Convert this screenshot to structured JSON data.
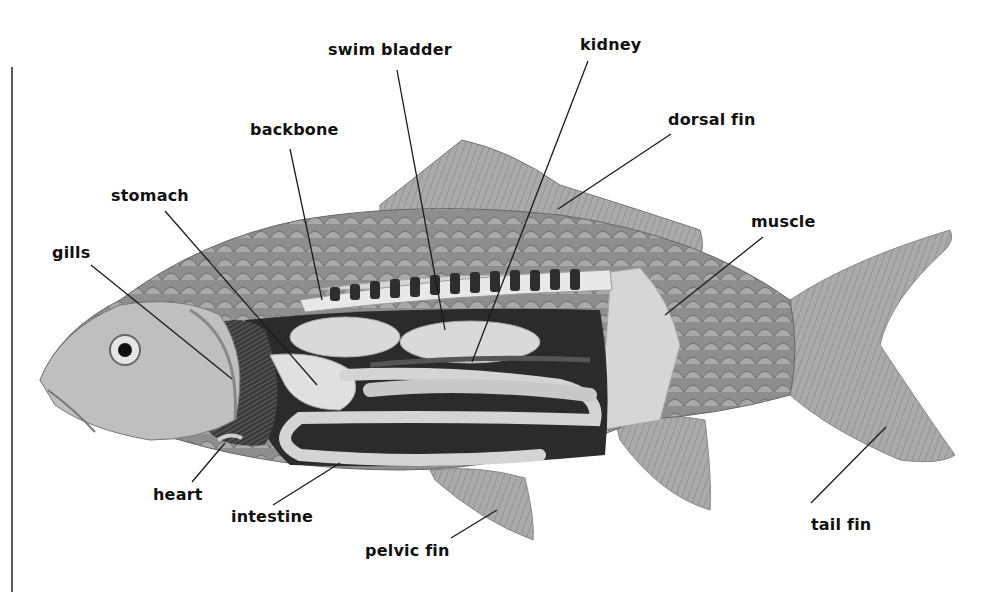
{
  "diagram": {
    "labels": [
      {
        "id": "swim-bladder",
        "text": "swim bladder",
        "x": 328,
        "y": 42,
        "line": [
          397,
          70,
          445,
          330
        ]
      },
      {
        "id": "kidney",
        "text": "kidney",
        "x": 580,
        "y": 37,
        "line": [
          588,
          61,
          472,
          362
        ]
      },
      {
        "id": "backbone",
        "text": "backbone",
        "x": 250,
        "y": 122,
        "line": [
          290,
          149,
          322,
          300
        ]
      },
      {
        "id": "dorsal-fin",
        "text": "dorsal fin",
        "x": 668,
        "y": 112,
        "line": [
          671,
          134,
          558,
          209
        ]
      },
      {
        "id": "stomach",
        "text": "stomach",
        "x": 111,
        "y": 188,
        "line": [
          165,
          211,
          317,
          385
        ]
      },
      {
        "id": "muscle",
        "text": "muscle",
        "x": 751,
        "y": 214,
        "line": [
          763,
          237,
          665,
          315
        ]
      },
      {
        "id": "gills",
        "text": "gills",
        "x": 52,
        "y": 245,
        "line": [
          91,
          265,
          232,
          379
        ]
      },
      {
        "id": "heart",
        "text": "heart",
        "x": 153,
        "y": 484,
        "line": [
          192,
          482,
          225,
          443
        ]
      },
      {
        "id": "intestine",
        "text": "intestine",
        "x": 231,
        "y": 505,
        "line": [
          273,
          505,
          340,
          463
        ]
      },
      {
        "id": "pelvic-fin",
        "text": "pelvic fin",
        "x": 365,
        "y": 540,
        "line": [
          451,
          538,
          497,
          510
        ]
      },
      {
        "id": "tail-fin",
        "text": "tail fin",
        "x": 811,
        "y": 513,
        "line": [
          811,
          503,
          886,
          427
        ]
      }
    ],
    "extra_label": {
      "id": "tail-fin-dup",
      "text": ""
    },
    "border_line": {
      "x": 12,
      "y1": 67,
      "y2": 592
    }
  },
  "colors": {
    "text": "#111111",
    "line": "#1a1a1a",
    "body_dark": "#6f6f6f",
    "body_mid": "#9a9a9a",
    "body_light": "#c8c8c8",
    "cavity": "#2b2b2b",
    "organ": "#d8d8d8",
    "fin": "#a8a8a8"
  }
}
